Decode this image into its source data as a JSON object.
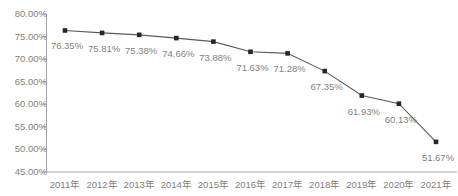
{
  "chart_data": {
    "type": "line",
    "title": "",
    "subtitle": "",
    "xlabel": "",
    "ylabel": "",
    "categories": [
      "2011年",
      "2012年",
      "2013年",
      "2014年",
      "2015年",
      "2016年",
      "2017年",
      "2018年",
      "2019年",
      "2020年",
      "2021年"
    ],
    "values": [
      76.35,
      75.81,
      75.38,
      74.66,
      73.88,
      71.63,
      71.28,
      67.35,
      61.93,
      60.13,
      51.67
    ],
    "data_labels": [
      "76.35%",
      "75.81%",
      "75.38%",
      "74.66%",
      "73.88%",
      "71.63%",
      "71.28%",
      "67.35%",
      "61.93%",
      "60.13%",
      "51.67%"
    ],
    "ylim": [
      45,
      80
    ],
    "ytick_values": [
      80,
      75,
      70,
      65,
      60,
      55,
      50,
      45
    ],
    "ytick_labels": [
      "80.00%",
      "75.00%",
      "70.00%",
      "65.00%",
      "60.00%",
      "55.00%",
      "50.00%",
      "45.00%"
    ],
    "grid": false,
    "legend": null,
    "series_name": "",
    "marker": "square",
    "colors": {
      "line": "#595959",
      "marker": "#262626",
      "axis": "#a6a6a6",
      "tick_text": "#7f7f7f",
      "data_label_text": "#7f7f7f",
      "background": "#ffffff"
    }
  }
}
